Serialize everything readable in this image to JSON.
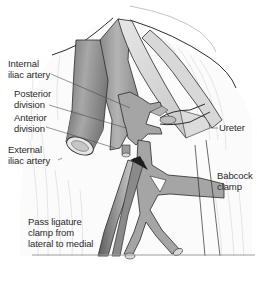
{
  "figure": {
    "type": "anatomical-illustration",
    "labels": {
      "internal_iliac_artery": "Internal\niliac artery",
      "posterior_division": "Posterior\ndivision",
      "anterior_division": "Anterior\ndivision",
      "external_iliac_artery": "External\niliac artery",
      "ureter": "Ureter",
      "babcock_clamp": "Babcock\nclamp",
      "pass_ligature": "Pass ligature\nclamp from\nlateral to medial"
    },
    "colors": {
      "vessel_fill": "#a9a9a9",
      "vessel_dark": "#7d7d7d",
      "vessel_light": "#d2d2d2",
      "outline": "#2b2b2b",
      "tissue_lines": "#c8c8c8",
      "background": "#ffffff"
    }
  }
}
